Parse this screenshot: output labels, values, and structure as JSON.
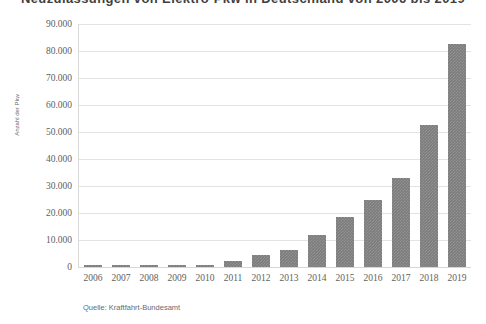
{
  "chart_data": {
    "type": "bar",
    "title": "Neuzulassungen von Elektro-Pkw in Deutschland von 2006 bis 2019",
    "xlabel": "",
    "ylabel": "Anzahl der Pkw",
    "categories": [
      "2006",
      "2007",
      "2008",
      "2009",
      "2010",
      "2011",
      "2012",
      "2013",
      "2014",
      "2015",
      "2016",
      "2017",
      "2018",
      "2019"
    ],
    "values": [
      500,
      500,
      500,
      500,
      541,
      2154,
      4541,
      6051,
      8522,
      12363,
      11410,
      25056,
      36062,
      63281
    ],
    "bar_values": [
      600,
      600,
      600,
      600,
      700,
      2100,
      4500,
      6400,
      12000,
      18500,
      25000,
      33000,
      52600,
      82600
    ],
    "ylim": [
      0,
      90000
    ],
    "ytick_values": [
      90000,
      80000,
      70000,
      60000,
      50000,
      40000,
      30000,
      20000,
      10000,
      0
    ],
    "ytick_labels": [
      "90.000",
      "80.000",
      "70.000",
      "60.000",
      "50.000",
      "40.000",
      "30.000",
      "20.000",
      "10.000",
      "0"
    ],
    "grid": true,
    "legend": null,
    "legend_position": "none",
    "series": [
      {
        "name": "Anzahl der Pkw",
        "values": [
          600,
          600,
          600,
          600,
          700,
          2100,
          4500,
          6400,
          12000,
          18500,
          25000,
          33000,
          52600,
          82600
        ]
      }
    ],
    "bar_color": "#7c7c7c",
    "grid_color": "#e3e3e3"
  },
  "footer": {
    "source": "Quelle: Kraftfahrt-Bundesamt"
  }
}
